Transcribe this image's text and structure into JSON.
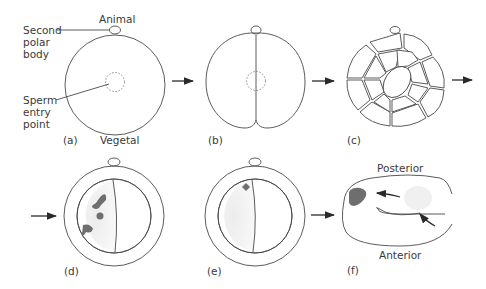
{
  "figure": {
    "panels": [
      {
        "id": "a",
        "label": "(a)",
        "stage": "fertilized egg"
      },
      {
        "id": "b",
        "label": "(b)",
        "stage": "first cleavage"
      },
      {
        "id": "c",
        "label": "(c)",
        "stage": "cleavage stage embryo"
      },
      {
        "id": "d",
        "label": "(d)",
        "stage": "embryo with marked cells"
      },
      {
        "id": "e",
        "label": "(e)",
        "stage": "embryo with single marked cell"
      },
      {
        "id": "f",
        "label": "(f)",
        "stage": "larva"
      }
    ],
    "annotations": {
      "animal": "Animal",
      "vegetal": "Vegetal",
      "second_polar_body": [
        "Second",
        "polar",
        "body"
      ],
      "sperm_entry_point": [
        "Sperm",
        "entry",
        "point"
      ],
      "posterior": "Posterior",
      "anterior": "Anterior"
    },
    "colors": {
      "outline": "#4a4a4a",
      "marked_cell": "#6e6e6e",
      "light_shade": "#e6e6e6",
      "background": "#ffffff"
    }
  }
}
